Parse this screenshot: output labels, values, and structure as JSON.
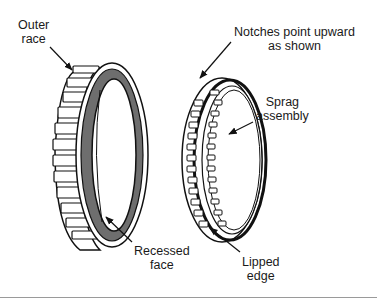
{
  "diagram": {
    "type": "technical-illustration",
    "colors": {
      "line": "#111111",
      "recessed_face": "#6e6e6e",
      "background": "#ffffff",
      "bottom_rule": "#9a9a9a"
    },
    "components": [
      {
        "id": "outer-race",
        "label": "Outer race"
      },
      {
        "id": "sprag-assembly",
        "label": "Sprag assembly"
      }
    ],
    "labels": {
      "outer_race": {
        "line1": "Outer",
        "line2": "race"
      },
      "notches": {
        "line1": "Notches point upward",
        "line2": "as shown"
      },
      "sprag": {
        "line1": "Sprag",
        "line2": "assembly"
      },
      "recessed": {
        "line1": "Recessed",
        "line2": "face"
      },
      "lipped": {
        "line1": "Lipped",
        "line2": "edge"
      }
    }
  }
}
